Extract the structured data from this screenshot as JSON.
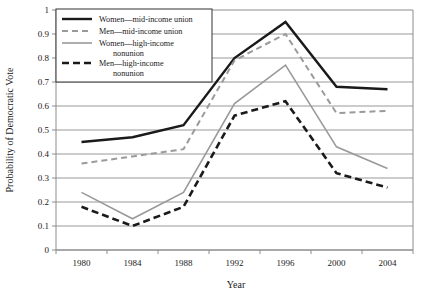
{
  "chart_data": {
    "type": "line",
    "title": "",
    "xlabel": "Year",
    "ylabel": "Probability of Democratic Vote",
    "x": [
      1980,
      1984,
      1988,
      1992,
      1996,
      2000,
      2004
    ],
    "categories": [
      "1980",
      "1984",
      "1988",
      "1992",
      "1996",
      "2000",
      "2004"
    ],
    "xlim": [
      1978,
      2006
    ],
    "ylim": [
      0,
      1
    ],
    "ytick_labels": [
      "0",
      "0.1",
      "0.2",
      "0.3",
      "0.4",
      "0.5",
      "0.6",
      "0.7",
      "0.8",
      "0.9",
      "1"
    ],
    "ytick_values": [
      0,
      0.1,
      0.2,
      0.3,
      0.4,
      0.5,
      0.6,
      0.7,
      0.8,
      0.9,
      1
    ],
    "grid": "horizontal",
    "legend_position": "top-left",
    "series": [
      {
        "name": "Women—mid-income union",
        "style": "solid",
        "color": "#1a1a1a",
        "width": 2.4,
        "values": [
          0.45,
          0.47,
          0.52,
          0.8,
          0.95,
          0.68,
          0.67
        ]
      },
      {
        "name": "Men—mid-income union",
        "style": "dashed",
        "color": "#9a9a9a",
        "width": 2.0,
        "values": [
          0.36,
          0.39,
          0.42,
          0.79,
          0.9,
          0.57,
          0.58
        ]
      },
      {
        "name": "Women—high-income nonunion",
        "style": "solid",
        "color": "#9a9a9a",
        "width": 1.6,
        "values": [
          0.24,
          0.13,
          0.24,
          0.61,
          0.77,
          0.43,
          0.34
        ]
      },
      {
        "name": "Men—high-income nonunion",
        "style": "dashed",
        "color": "#1a1a1a",
        "width": 2.6,
        "values": [
          0.18,
          0.1,
          0.18,
          0.56,
          0.62,
          0.32,
          0.26
        ]
      }
    ]
  },
  "legend": {
    "entries": [
      {
        "label_line1": "Women—mid-income union",
        "label_line2": ""
      },
      {
        "label_line1": "Men—mid-income union",
        "label_line2": ""
      },
      {
        "label_line1": "Women—high-income",
        "label_line2": "nonunion"
      },
      {
        "label_line1": "Men—high-income",
        "label_line2": "nonunion"
      }
    ]
  }
}
